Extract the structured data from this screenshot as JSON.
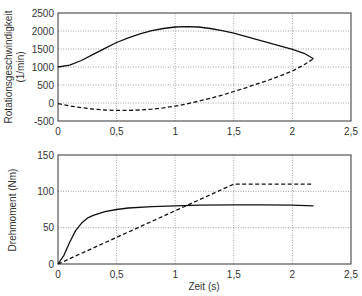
{
  "chart_data": [
    {
      "type": "line",
      "title": "",
      "xlabel": "",
      "ylabel": "Rotationsgeschwindigkeit (1/min)",
      "ylabel_lines": [
        "Rotationsgeschwindigkeit",
        "(1/min)"
      ],
      "xlim": [
        0,
        2.5
      ],
      "ylim": [
        -500,
        2500
      ],
      "xticks": [
        "0",
        "0,5",
        "1",
        "1,5",
        "2",
        "2,5"
      ],
      "yticks": [
        "2500",
        "2000",
        "1500",
        "1000",
        "500",
        "0",
        "-500"
      ],
      "grid": true,
      "series": [
        {
          "name": "solid",
          "style": "solid",
          "x": [
            0,
            0.1,
            0.2,
            0.3,
            0.4,
            0.5,
            0.6,
            0.7,
            0.8,
            0.9,
            1.0,
            1.1,
            1.2,
            1.3,
            1.4,
            1.5,
            1.6,
            1.7,
            1.8,
            1.9,
            2.0,
            2.1,
            2.18
          ],
          "y": [
            1000,
            1050,
            1180,
            1350,
            1520,
            1680,
            1810,
            1920,
            2010,
            2070,
            2110,
            2120,
            2110,
            2070,
            2010,
            1940,
            1850,
            1760,
            1670,
            1580,
            1490,
            1380,
            1230
          ]
        },
        {
          "name": "dashed",
          "style": "dashed",
          "x": [
            0,
            0.1,
            0.2,
            0.3,
            0.4,
            0.5,
            0.6,
            0.7,
            0.8,
            0.9,
            1.0,
            1.1,
            1.2,
            1.3,
            1.4,
            1.5,
            1.6,
            1.7,
            1.8,
            1.9,
            2.0,
            2.1,
            2.18
          ],
          "y": [
            -20,
            -80,
            -130,
            -170,
            -195,
            -205,
            -205,
            -195,
            -170,
            -135,
            -85,
            -25,
            50,
            130,
            220,
            320,
            420,
            530,
            640,
            760,
            890,
            1060,
            1230
          ]
        }
      ]
    },
    {
      "type": "line",
      "title": "",
      "xlabel": "Zeit (s)",
      "ylabel": "Drehmoment (Nm)",
      "xlim": [
        0,
        2.5
      ],
      "ylim": [
        0,
        150
      ],
      "xticks": [
        "0",
        "0,5",
        "1",
        "1,5",
        "2",
        "2,5"
      ],
      "yticks": [
        "150",
        "100",
        "50",
        "0"
      ],
      "grid": true,
      "series": [
        {
          "name": "solid",
          "style": "solid",
          "x": [
            0,
            0.05,
            0.1,
            0.15,
            0.2,
            0.25,
            0.3,
            0.4,
            0.5,
            0.6,
            0.8,
            1.0,
            1.2,
            1.5,
            1.75,
            2.0,
            2.18
          ],
          "y": [
            0,
            12,
            30,
            46,
            56,
            63,
            67,
            72,
            75,
            77,
            79,
            80,
            81,
            81.5,
            81.5,
            81,
            80
          ]
        },
        {
          "name": "dashed",
          "style": "dashed",
          "x": [
            0,
            1.5,
            2.18
          ],
          "y": [
            0,
            110,
            110
          ]
        }
      ]
    }
  ]
}
